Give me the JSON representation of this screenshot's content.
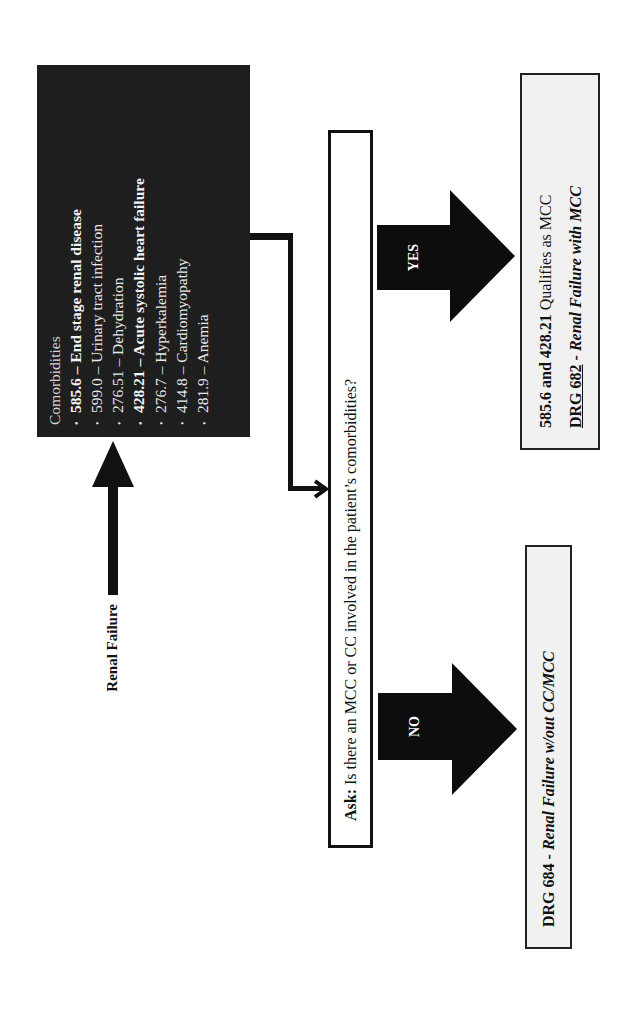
{
  "diagram": {
    "start_label": "Renal Failure",
    "comorbidities": {
      "title": "Comorbidities",
      "items": [
        {
          "code": "585.6",
          "sep": " – ",
          "desc": "End stage renal disease",
          "bold": true
        },
        {
          "code": "599.0",
          "sep": " – ",
          "desc": "Urinary tract infection",
          "bold": false
        },
        {
          "code": "276.51",
          "sep": " – ",
          "desc": "Dehydration",
          "bold": false
        },
        {
          "code": "428.21",
          "sep": " – ",
          "desc": "Acute systolic heart failure",
          "bold": true
        },
        {
          "code": "276.7",
          "sep": " – ",
          "desc": "Hyperkalemia",
          "bold": false
        },
        {
          "code": "414.8",
          "sep": " – ",
          "desc": "Cardiomyopathy",
          "bold": false
        },
        {
          "code": "281.9",
          "sep": " – ",
          "desc": "Anemia",
          "bold": false
        }
      ],
      "bullet": "•"
    },
    "question": {
      "prefix": "Ask:",
      "text": " Is there an MCC or CC involved in the patient’s comorbidities?"
    },
    "yes_branch": {
      "label": "YES",
      "line1_bold": "585.6 and 428.21",
      "line1_rest": " Qualifies as MCC",
      "drg_code": "DRG 682",
      "drg_sep": " - ",
      "drg_desc": "Renal Failure with MCC"
    },
    "no_branch": {
      "label": "NO",
      "drg_code": "DRG 684",
      "drg_sep": " - ",
      "drg_desc": "Renal Failure w/out CC/MCC"
    },
    "colors": {
      "comorbidities_bg": "#1e1e1e",
      "arrow": "#0d0d0d",
      "result_bg": "#f1f1f1",
      "border": "#111111"
    }
  }
}
